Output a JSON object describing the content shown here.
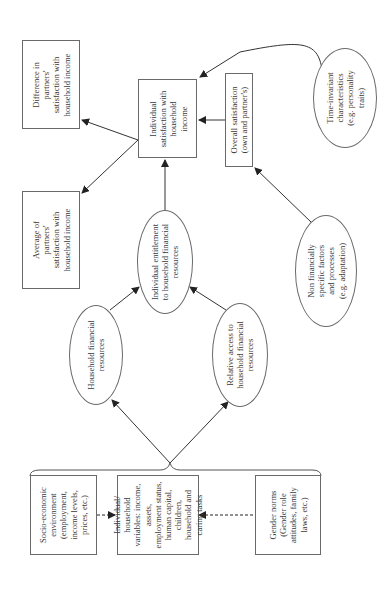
{
  "diagram": {
    "orientation": "rotated -90deg (reads bottom-to-top)",
    "nodes": {
      "socio_economic": {
        "lines": [
          "Socio-economic",
          "environment",
          "(employment,",
          "income levels,",
          "prices, etc.)"
        ]
      },
      "individual_household_vars": {
        "lines": [
          "Individual/",
          "household",
          "variables: income,",
          "assets,",
          "employment status,",
          "human capital,",
          "children,",
          "household and",
          "caring tasks"
        ]
      },
      "gender_norms": {
        "lines": [
          "Gender norms",
          "(Gender role",
          "attitudes, family",
          "laws, etc.)"
        ]
      },
      "household_financial_resources": {
        "lines": [
          "Household financial",
          "resources"
        ]
      },
      "relative_access": {
        "lines": [
          "Relative access to",
          "household financial",
          "resources"
        ]
      },
      "individual_entitlement": {
        "lines": [
          "Individual entitlement",
          "to household financial",
          "resources"
        ]
      },
      "individual_satisfaction": {
        "lines": [
          "Individual",
          "satisfaction with",
          "household",
          "income"
        ]
      },
      "overall_satisfaction": {
        "lines": [
          "Overall satisfaction",
          "(own and partner's)"
        ]
      },
      "difference_partners": {
        "lines": [
          "Difference in",
          "partners'",
          "satisfaction with",
          "household income"
        ]
      },
      "average_partners": {
        "lines": [
          "Average of",
          "partners'",
          "satisfaction with",
          "household income"
        ]
      },
      "time_invariant": {
        "lines": [
          "Time-invariant",
          "characteristics",
          "(e.g. personality",
          "traits)"
        ]
      },
      "non_financial": {
        "lines": [
          "Non financially",
          "specific factors",
          "and processes",
          "(e.g. adaptation)"
        ]
      }
    },
    "edges": [
      {
        "from": "socio_economic",
        "to": "individual_household_vars",
        "style": "dashed"
      },
      {
        "from": "gender_norms",
        "to": "individual_household_vars",
        "style": "dashed"
      },
      {
        "from": "inputs_group",
        "to": "household_financial_resources",
        "style": "solid"
      },
      {
        "from": "inputs_group",
        "to": "relative_access",
        "style": "solid"
      },
      {
        "from": "household_financial_resources",
        "to": "individual_entitlement",
        "style": "solid"
      },
      {
        "from": "relative_access",
        "to": "individual_entitlement",
        "style": "solid"
      },
      {
        "from": "individual_entitlement",
        "to": "individual_satisfaction",
        "style": "solid"
      },
      {
        "from": "overall_satisfaction",
        "to": "individual_satisfaction",
        "style": "solid"
      },
      {
        "from": "time_invariant",
        "to": "individual_satisfaction",
        "style": "curved"
      },
      {
        "from": "non_financial",
        "to": "overall_satisfaction",
        "style": "solid"
      },
      {
        "from": "individual_satisfaction",
        "to": "difference_partners",
        "style": "solid"
      },
      {
        "from": "individual_satisfaction",
        "to": "average_partners",
        "style": "solid"
      }
    ]
  }
}
